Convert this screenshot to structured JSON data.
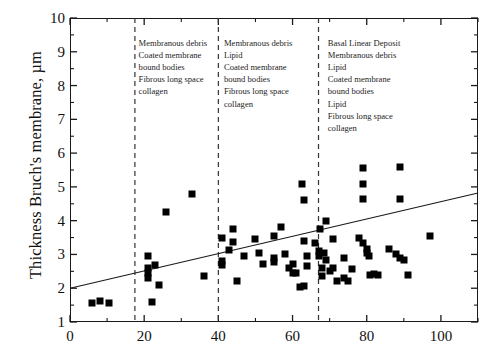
{
  "chart_data": {
    "type": "scatter",
    "title": "",
    "xlabel": "",
    "ylabel": "Thickness Bruch's membrane, µm",
    "xlim": [
      0,
      110
    ],
    "ylim": [
      1,
      10
    ],
    "grid": false,
    "legend": "none",
    "x_ticks_major": [
      0,
      20,
      40,
      60,
      80,
      100
    ],
    "x_tick_labels": [
      "0",
      "20",
      "40",
      "60",
      "80",
      "100"
    ],
    "x_ticks_minor": [
      10,
      30,
      50,
      70,
      90,
      110
    ],
    "y_ticks_major": [
      1,
      2,
      3,
      4,
      5,
      6,
      7,
      8,
      9,
      10
    ],
    "y_tick_labels": [
      "1",
      "2",
      "3",
      "4",
      "5",
      "6",
      "7",
      "8",
      "9",
      "10"
    ],
    "y_ticks_minor": [
      1.5,
      2.5,
      3.5,
      4.5,
      5.5,
      6.5,
      7.5,
      8.5,
      9.5
    ],
    "marker": "square",
    "marker_color": "#000000",
    "points": [
      [
        6,
        1.55
      ],
      [
        8,
        1.62
      ],
      [
        10.5,
        1.57
      ],
      [
        22,
        1.6
      ],
      [
        21,
        2.95
      ],
      [
        21,
        2.6
      ],
      [
        21,
        2.45
      ],
      [
        21,
        2.3
      ],
      [
        23,
        2.68
      ],
      [
        24,
        2.1
      ],
      [
        26,
        4.25
      ],
      [
        33,
        4.8
      ],
      [
        36,
        2.35
      ],
      [
        41,
        3.5
      ],
      [
        41,
        2.8
      ],
      [
        41,
        2.68
      ],
      [
        43,
        3.12
      ],
      [
        44,
        3.75
      ],
      [
        44,
        3.38
      ],
      [
        45,
        2.2
      ],
      [
        47,
        2.95
      ],
      [
        50,
        3.45
      ],
      [
        51,
        3.05
      ],
      [
        52,
        2.72
      ],
      [
        55,
        3.55
      ],
      [
        55,
        2.9
      ],
      [
        55,
        2.78
      ],
      [
        57,
        3.8
      ],
      [
        58,
        3.0
      ],
      [
        59,
        2.6
      ],
      [
        60,
        2.72
      ],
      [
        60,
        2.45
      ],
      [
        61,
        2.45
      ],
      [
        62,
        2.05
      ],
      [
        63,
        2.08
      ],
      [
        62.5,
        5.1
      ],
      [
        63,
        4.6
      ],
      [
        63,
        3.4
      ],
      [
        64,
        2.95
      ],
      [
        64,
        2.65
      ],
      [
        66,
        3.35
      ],
      [
        67,
        3.1
      ],
      [
        67,
        2.95
      ],
      [
        67.5,
        3.75
      ],
      [
        68,
        2.6
      ],
      [
        68,
        2.35
      ],
      [
        68.5,
        3.05
      ],
      [
        69,
        4.0
      ],
      [
        69,
        2.85
      ],
      [
        70,
        2.5
      ],
      [
        71,
        3.45
      ],
      [
        71,
        2.6
      ],
      [
        72,
        2.2
      ],
      [
        74,
        2.9
      ],
      [
        74,
        2.3
      ],
      [
        75,
        2.2
      ],
      [
        76,
        2.58
      ],
      [
        78,
        3.5
      ],
      [
        79,
        5.55
      ],
      [
        79,
        5.1
      ],
      [
        79,
        4.65
      ],
      [
        79,
        3.35
      ],
      [
        80,
        3.15
      ],
      [
        80,
        3.05
      ],
      [
        80.5,
        2.95
      ],
      [
        81,
        2.4
      ],
      [
        82,
        2.42
      ],
      [
        83,
        2.4
      ],
      [
        86,
        3.15
      ],
      [
        88,
        3.0
      ],
      [
        89,
        5.6
      ],
      [
        89,
        4.65
      ],
      [
        89,
        2.9
      ],
      [
        90,
        2.85
      ],
      [
        91,
        2.4
      ],
      [
        97,
        3.55
      ]
    ],
    "regression_line": {
      "x_start": 0,
      "y_start": 2.0,
      "x_end": 110,
      "y_end": 4.82,
      "style": "solid"
    },
    "divider_lines": [
      {
        "x": 17.5,
        "style": "dashed"
      },
      {
        "x": 40,
        "style": "dashed"
      },
      {
        "x": 67,
        "style": "dashed"
      }
    ],
    "annotations": [
      {
        "id": "zone-1",
        "x": 18.5,
        "y_top": 9.45,
        "lines": [
          "Membranous debris",
          "Coated membrane",
          "bound bodies",
          "Fibrous long space",
          "collagen"
        ]
      },
      {
        "id": "zone-2",
        "x": 41.5,
        "y_top": 9.45,
        "lines": [
          "Membranous debris",
          "Lipid",
          "Coated membrane",
          "bound bodies",
          "Fibrous long space",
          "collagen"
        ]
      },
      {
        "id": "zone-3",
        "x": 69.5,
        "y_top": 9.45,
        "lines": [
          "Basal Linear Deposit",
          "Membranous debris",
          "Lipid",
          "Coated membrane",
          "bound bodies",
          "Lipid",
          "Fibrous long space",
          "collagen"
        ]
      }
    ]
  },
  "colors": {
    "axis": "#1a1a1a",
    "marker": "#000000",
    "divider": "#333333",
    "text": "#111111",
    "background": "#ffffff"
  }
}
